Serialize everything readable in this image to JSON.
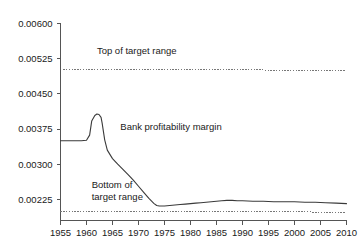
{
  "chart_data": {
    "type": "line",
    "title": "",
    "subtitle": "",
    "xlabel": "",
    "ylabel": "",
    "xlim": [
      1955,
      2010
    ],
    "ylim": [
      0.0018,
      0.006
    ],
    "grid": false,
    "legend_position": "inline-annotations",
    "x_ticks": [
      1955,
      1960,
      1965,
      1970,
      1975,
      1980,
      1985,
      1990,
      1995,
      2000,
      2005,
      2010
    ],
    "x_tick_labels": [
      "1955",
      "1960",
      "1965",
      "1970",
      "1975",
      "1980",
      "1985",
      "1990",
      "1995",
      "2000",
      "2005",
      "2010"
    ],
    "y_ticks": [
      0.00225,
      0.003,
      0.00375,
      0.0045,
      0.00525,
      0.006
    ],
    "y_tick_labels": [
      "0.00225",
      "0.00300",
      "0.00375",
      "0.00450",
      "0.00525",
      "0.00600"
    ],
    "series": [
      {
        "name": "Bank profitability margin",
        "style": "solid",
        "color": "#3a3a3a",
        "x": [
          1955,
          1956,
          1957,
          1958,
          1959,
          1960,
          1960.6,
          1961,
          1961.6,
          1962,
          1962.4,
          1962.8,
          1963,
          1963.5,
          1964,
          1965,
          1966,
          1967,
          1968,
          1969,
          1970,
          1971,
          1972,
          1973,
          1973.5,
          1974,
          1975,
          1976,
          1977,
          1978,
          1979,
          1980,
          1981,
          1982,
          1983,
          1984,
          1985,
          1986,
          1987,
          1988,
          1989,
          1990,
          1992,
          1994,
          1996,
          1998,
          2000,
          2002,
          2004,
          2006,
          2008,
          2010
        ],
        "y": [
          0.0035,
          0.0035,
          0.0035,
          0.0035,
          0.0035,
          0.00351,
          0.00362,
          0.00392,
          0.00404,
          0.00407,
          0.00406,
          0.004,
          0.00388,
          0.00352,
          0.0033,
          0.00312,
          0.003,
          0.00289,
          0.00278,
          0.00266,
          0.00253,
          0.0024,
          0.00227,
          0.00216,
          0.00212,
          0.00211,
          0.00211,
          0.00212,
          0.00213,
          0.00214,
          0.00215,
          0.00216,
          0.00217,
          0.00218,
          0.00219,
          0.0022,
          0.00221,
          0.00222,
          0.00223,
          0.00223,
          0.00222,
          0.00222,
          0.00221,
          0.00221,
          0.0022,
          0.0022,
          0.0022,
          0.00219,
          0.00219,
          0.00218,
          0.00217,
          0.00216
        ]
      },
      {
        "name": "Top of target range",
        "style": "dotted",
        "color": "#777777",
        "x": [
          1955,
          2010
        ],
        "y": [
          0.00503,
          0.005
        ]
      },
      {
        "name": "Bottom of target range",
        "style": "dotted",
        "color": "#777777",
        "x": [
          1955,
          2010
        ],
        "y": [
          0.00199,
          0.00198
        ]
      }
    ],
    "annotations": [
      {
        "id": "top-of-target-range",
        "text": "Top of target range",
        "lines": [
          "Top of target range"
        ],
        "x": 1962.0,
        "y": 0.00536
      },
      {
        "id": "bank-profitability-margin",
        "text": "Bank profitability margin",
        "lines": [
          "Bank profitability margin"
        ],
        "x": 1966.5,
        "y": 0.00372
      },
      {
        "id": "bottom-of-target-range",
        "text": "Bottom of target range",
        "lines": [
          "Bottom of",
          "target range"
        ],
        "x": 1961.0,
        "y": 0.00249
      }
    ]
  }
}
